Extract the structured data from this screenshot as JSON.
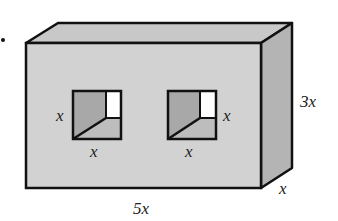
{
  "diagram": {
    "type": "rectangular-prism-with-square-holes",
    "colors": {
      "front_face": "#d2d2d2",
      "top_face": "#c8c8c8",
      "side_face": "#b4b4b4",
      "hole_back": "#a8a8a8",
      "hole_floor": "#bdbdbd",
      "hole_light": "#ffffff",
      "edge": "#111111"
    },
    "labels": {
      "left_hole_height": "x",
      "left_hole_width": "x",
      "right_hole_height": "x",
      "right_hole_width": "x",
      "prism_height": "3x",
      "prism_depth": "x",
      "prism_length": "5x"
    },
    "bullet": "•"
  }
}
